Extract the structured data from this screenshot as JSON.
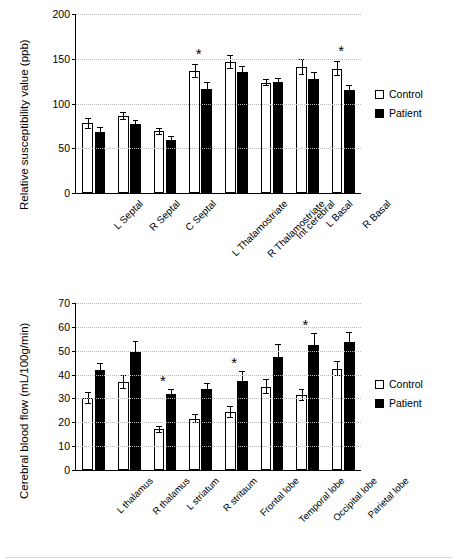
{
  "legend": {
    "control": "Control",
    "patient": "Patient"
  },
  "chart_data": [
    {
      "type": "bar",
      "title": "",
      "ylabel": "Relative susceptibility value (ppb)",
      "xlabel": "",
      "ylim": [
        0,
        200
      ],
      "yticks": [
        0,
        50,
        100,
        150,
        200
      ],
      "grid": true,
      "legend_position": "right",
      "categories": [
        "L Septal",
        "R Septal",
        "C Septal",
        "L Thalamostriate",
        "R Thalamostriate",
        "Int cerebral",
        "L Basal",
        "R Basal"
      ],
      "series": [
        {
          "name": "Control",
          "values": [
            78,
            86,
            69,
            136,
            146,
            123,
            141,
            139
          ],
          "errors": [
            6,
            4,
            4,
            8,
            8,
            4,
            9,
            8
          ]
        },
        {
          "name": "Patient",
          "values": [
            68,
            77,
            59,
            116,
            135,
            124,
            127,
            115
          ],
          "errors": [
            6,
            5,
            5,
            8,
            7,
            5,
            8,
            6
          ]
        }
      ],
      "annotations": [
        {
          "label": "*",
          "category": "L Thalamostriate"
        },
        {
          "label": "*",
          "category": "R Basal"
        }
      ]
    },
    {
      "type": "bar",
      "title": "",
      "ylabel": "Cerebral blood flow (mL/100g/min)",
      "xlabel": "",
      "ylim": [
        0,
        70
      ],
      "yticks": [
        0,
        10,
        20,
        30,
        40,
        50,
        60,
        70
      ],
      "grid": true,
      "legend_position": "right",
      "categories": [
        "L thalamus",
        "R thalamus",
        "L striatum",
        "R stritaum",
        "Frontal lobe",
        "Temporal lobe",
        "Occipital lobe",
        "Parietal lobe"
      ],
      "series": [
        {
          "name": "Control",
          "values": [
            30,
            37,
            17,
            21.5,
            24.5,
            35,
            31.5,
            42.5
          ],
          "errors": [
            2.5,
            3,
            1.5,
            2,
            2.5,
            3,
            2.5,
            3
          ]
        },
        {
          "name": "Patient",
          "values": [
            42,
            49.5,
            32,
            34,
            37.5,
            47.5,
            52.5,
            53.5
          ],
          "errors": [
            3,
            4.5,
            2,
            2.5,
            4,
            5.5,
            5,
            4.5
          ]
        }
      ],
      "annotations": [
        {
          "label": "*",
          "category": "L striatum"
        },
        {
          "label": "*",
          "category": "Frontal lobe"
        },
        {
          "label": "*",
          "category": "Occipital lobe"
        }
      ]
    }
  ]
}
